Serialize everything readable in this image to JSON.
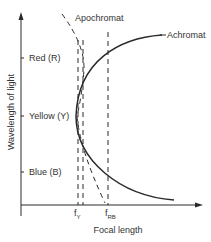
{
  "diagram": {
    "type": "chromatic-aberration-focal-length-diagram",
    "x_axis": {
      "label": "Focal length",
      "ticks": [
        {
          "main": "f",
          "sub": "Y"
        },
        {
          "main": "f",
          "sub": "RB"
        }
      ]
    },
    "y_axis": {
      "label": "Wavelength of light",
      "ticks": [
        "Red (R)",
        "Yellow (Y)",
        "Blue (B)"
      ]
    },
    "curves": [
      {
        "name": "Achromat",
        "style": "solid"
      },
      {
        "name": "Apochromat",
        "style": "dashed"
      }
    ],
    "colors": {
      "line": "#2a2a2a",
      "text": "#333333",
      "background": "#ffffff"
    }
  }
}
